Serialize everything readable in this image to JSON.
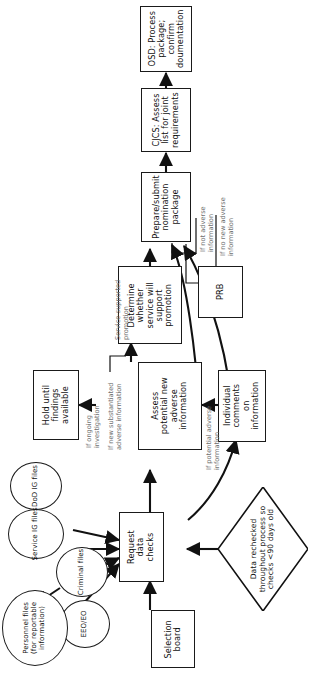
{
  "diagram": {
    "orientation": "rotated-90",
    "nodes": {
      "osd": "OSD: Process package; confirm doumentation",
      "cjcs": "CJCS: Assess list for joint requirements",
      "prepare": "Prepare/submit nomination package",
      "prb": "PRB",
      "determine": "Determine whether service will support promotion",
      "hold": "Hold until findings available",
      "assess": "Assess potential new adverse information",
      "individual": "Individual comments on information",
      "request": "Request data checks",
      "selection_board": "Selection board",
      "recheck": "Data rechecked throughout process so checks <90 days old",
      "dod_ig": "DoD IG files",
      "service_ig": "Service IG files",
      "criminal": "Criminal files",
      "eeo": "EEO/EO",
      "personnel": "Personnel files (for reportable information)"
    },
    "edge_labels": {
      "service_supported": "Service-supported promotion",
      "if_new_substantiated": "If new substantiated adverse information",
      "if_ongoing": "If ongoing investigation",
      "if_potential": "If potential adverse information",
      "if_not_adverse": "If not adverse information",
      "if_no_new_adverse": "If no new adverse information"
    },
    "colors": {
      "stroke": "#1a1a1a",
      "text": "#111111",
      "caption": "#6f6f6f",
      "background": "#ffffff"
    }
  }
}
